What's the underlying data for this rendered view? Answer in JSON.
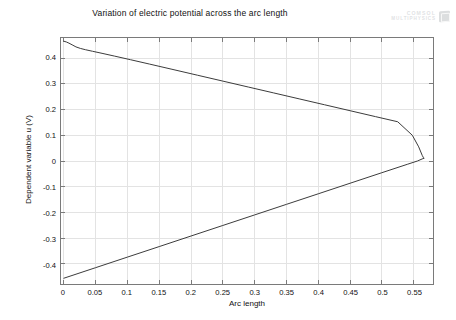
{
  "chart_data": {
    "type": "line",
    "title": "Variation of electric potential across the arc length",
    "xlabel": "Arc length",
    "ylabel": "Dependent variable u (V)",
    "xlim": [
      -0.0045,
      0.5805
    ],
    "ylim": [
      -0.478,
      0.478
    ],
    "xticks": [
      0,
      0.05,
      0.1,
      0.15,
      0.2,
      0.25,
      0.3,
      0.35,
      0.4,
      0.45,
      0.5,
      0.55
    ],
    "xticklabels": [
      "0",
      "0.05",
      "0.1",
      "0.15",
      "0.2",
      "0.25",
      "0.3",
      "0.35",
      "0.4",
      "0.45",
      "0.5",
      "0.55"
    ],
    "yticks": [
      0.4,
      0.3,
      0.2,
      0.1,
      0,
      -0.1,
      -0.2,
      -0.3,
      -0.4
    ],
    "yticklabels": [
      "0.4",
      "0.3",
      "0.2",
      "0.1",
      "0",
      "-0.1",
      "-0.2",
      "-0.3",
      "-0.4"
    ],
    "grid": true,
    "legend": "none",
    "line_color": "#3c3c3c",
    "grid_color": "#e3e3e3",
    "axis_color": "#7a7a7a",
    "series": [
      {
        "name": "upper-branch",
        "x": [
          0.0,
          0.004,
          0.008,
          0.013,
          0.019,
          0.026,
          0.034,
          0.045,
          0.06,
          0.08,
          0.105,
          0.135,
          0.17,
          0.21,
          0.25,
          0.29,
          0.33,
          0.37,
          0.41,
          0.45,
          0.49,
          0.525,
          0.548,
          0.558,
          0.5635,
          0.5655,
          0.566
        ],
        "y": [
          0.4655,
          0.4625,
          0.458,
          0.4515,
          0.4435,
          0.4375,
          0.4325,
          0.4265,
          0.4185,
          0.4075,
          0.3935,
          0.3765,
          0.3565,
          0.3335,
          0.3105,
          0.2875,
          0.2645,
          0.2415,
          0.2185,
          0.1955,
          0.1725,
          0.1525,
          0.1,
          0.055,
          0.022,
          0.013,
          0.0105
        ]
      },
      {
        "name": "lower-branch",
        "x": [
          0.0,
          0.05,
          0.1,
          0.15,
          0.2,
          0.25,
          0.3,
          0.35,
          0.4,
          0.45,
          0.5,
          0.54,
          0.556,
          0.5635,
          0.566
        ],
        "y": [
          -0.4555,
          -0.4145,
          -0.3735,
          -0.3325,
          -0.2915,
          -0.2505,
          -0.2095,
          -0.1685,
          -0.1275,
          -0.0865,
          -0.0455,
          -0.013,
          0.0,
          0.008,
          0.0105
        ]
      }
    ]
  },
  "logo": {
    "line1": "COMSOL",
    "line2": "MULTIPHYSICS"
  }
}
